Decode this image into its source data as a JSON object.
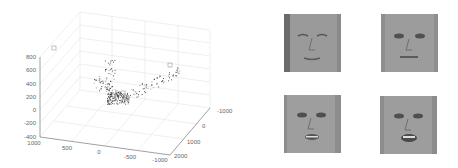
{
  "chart_data": {
    "type": "scatter3d",
    "title": "",
    "xlabel": "",
    "ylabel": "",
    "zlabel": "",
    "x_ticks": [
      "1000",
      "500",
      "0",
      "-500",
      "-1000"
    ],
    "y_ticks": [
      "-1000",
      "0",
      "1000",
      "2000"
    ],
    "z_ticks": [
      "800",
      "600",
      "400",
      "200",
      "0",
      "-200",
      "-400"
    ],
    "xlim": [
      -1000,
      1000
    ],
    "ylim": [
      -1000,
      2000
    ],
    "zlim": [
      -400,
      800
    ],
    "grid": true,
    "legend": null,
    "series": [
      {
        "name": "embedding points",
        "color": "#333333",
        "description": "Dense cluster of ~300 points forming a U-shaped manifold, densest near x≈0, y≈0, z≈100; branches rise to ≈600 on both ends",
        "highlighted_markers": [
          {
            "label": "face-1",
            "approx": [
              900,
              -900,
              850
            ]
          },
          {
            "label": "face-2",
            "approx": [
              -800,
              -800,
              600
            ]
          },
          {
            "label": "face-3",
            "approx": [
              100,
              200,
              150
            ]
          },
          {
            "label": "face-4",
            "approx": [
              50,
              250,
              120
            ]
          }
        ]
      }
    ]
  },
  "faces": [
    {
      "id": "face-top-left",
      "expression": "eyes closed, looking down"
    },
    {
      "id": "face-top-right",
      "expression": "neutral, mouth closed"
    },
    {
      "id": "face-bottom-left",
      "expression": "mouth slightly open"
    },
    {
      "id": "face-bottom-right",
      "expression": "mouth open, speaking"
    }
  ]
}
